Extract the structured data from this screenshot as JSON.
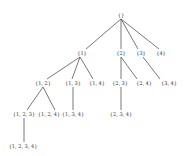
{
  "diagram": {
    "title": "",
    "type": "tree",
    "line_color": "#555555",
    "text_color": "#333333",
    "nodes": [
      {
        "id": "n0",
        "label": "{}",
        "x": 121,
        "y": 15
      },
      {
        "id": "n1",
        "label": "{1}",
        "x": 82,
        "y": 53
      },
      {
        "id": "n2",
        "label": "{2}",
        "x": 121,
        "y": 53
      },
      {
        "id": "n3",
        "label": "{3}",
        "x": 141,
        "y": 53
      },
      {
        "id": "n4",
        "label": "{4}",
        "x": 161,
        "y": 53
      },
      {
        "id": "n12",
        "label": "{1, 2}",
        "x": 43,
        "y": 83
      },
      {
        "id": "n13",
        "label": "{1, 3}",
        "x": 73,
        "y": 83
      },
      {
        "id": "n14",
        "label": "{1, 4}",
        "x": 97,
        "y": 83
      },
      {
        "id": "n23",
        "label": "{2, 3}",
        "x": 120,
        "y": 83
      },
      {
        "id": "n24",
        "label": "{2, 4}",
        "x": 144,
        "y": 83
      },
      {
        "id": "n34",
        "label": "{3, 4}",
        "x": 169,
        "y": 83
      },
      {
        "id": "n123",
        "label": "{1, 2, 3}",
        "x": 24,
        "y": 114
      },
      {
        "id": "n124",
        "label": "{1, 2, 4}",
        "x": 49,
        "y": 114
      },
      {
        "id": "n134",
        "label": "{1, 3, 4}",
        "x": 73,
        "y": 114
      },
      {
        "id": "n234",
        "label": "{2, 3, 4}",
        "x": 121,
        "y": 114
      },
      {
        "id": "n1234",
        "label": "{1, 2, 3, 4}",
        "x": 23,
        "y": 146
      }
    ],
    "edges": [
      {
        "from": "n0",
        "to": "n1",
        "x1": 121,
        "y1": 19,
        "x2": 86,
        "y2": 49
      },
      {
        "from": "n0",
        "to": "n2",
        "x1": 121,
        "y1": 19,
        "x2": 121,
        "y2": 49
      },
      {
        "from": "n0",
        "to": "n3",
        "x1": 121,
        "y1": 19,
        "x2": 138,
        "y2": 49
      },
      {
        "from": "n0",
        "to": "n4",
        "x1": 121,
        "y1": 19,
        "x2": 159,
        "y2": 49
      },
      {
        "from": "n1",
        "to": "n12",
        "x1": 80,
        "y1": 57,
        "x2": 47,
        "y2": 79
      },
      {
        "from": "n1",
        "to": "n13",
        "x1": 80,
        "y1": 57,
        "x2": 72,
        "y2": 79
      },
      {
        "from": "n1",
        "to": "n14",
        "x1": 80,
        "y1": 57,
        "x2": 93,
        "y2": 79
      },
      {
        "from": "n2",
        "to": "n23",
        "x1": 121,
        "y1": 57,
        "x2": 121,
        "y2": 79
      },
      {
        "from": "n2",
        "to": "n24",
        "x1": 121,
        "y1": 57,
        "x2": 137,
        "y2": 79
      },
      {
        "from": "n3",
        "to": "n34",
        "x1": 143,
        "y1": 57,
        "x2": 160,
        "y2": 79
      },
      {
        "from": "n12",
        "to": "n123",
        "x1": 43,
        "y1": 87,
        "x2": 27,
        "y2": 110
      },
      {
        "from": "n12",
        "to": "n124",
        "x1": 43,
        "y1": 87,
        "x2": 55,
        "y2": 110
      },
      {
        "from": "n13",
        "to": "n134",
        "x1": 73,
        "y1": 87,
        "x2": 73,
        "y2": 110
      },
      {
        "from": "n23",
        "to": "n234",
        "x1": 121,
        "y1": 87,
        "x2": 121,
        "y2": 110
      },
      {
        "from": "n123",
        "to": "n1234",
        "x1": 24,
        "y1": 118,
        "x2": 24,
        "y2": 142
      }
    ]
  }
}
